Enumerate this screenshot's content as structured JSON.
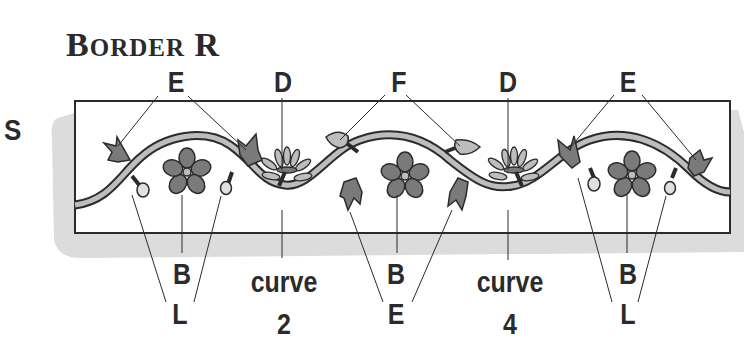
{
  "title": {
    "first": "B",
    "rest": "ORDER",
    "suffix": "R"
  },
  "side_label": "S",
  "top_labels": [
    {
      "text": "E",
      "x": 176
    },
    {
      "text": "D",
      "x": 283
    },
    {
      "text": "F",
      "x": 399
    },
    {
      "text": "D",
      "x": 508
    },
    {
      "text": "E",
      "x": 628
    }
  ],
  "bottom_labels": [
    {
      "text": "B",
      "x": 182
    },
    {
      "text": "L",
      "x": 180
    },
    {
      "text": "curve",
      "x": 284
    },
    {
      "text": "2",
      "x": 284
    },
    {
      "text": "B",
      "x": 396
    },
    {
      "text": "E",
      "x": 396
    },
    {
      "text": "curve",
      "x": 510
    },
    {
      "text": "4",
      "x": 510
    },
    {
      "text": "B",
      "x": 628
    },
    {
      "text": "L",
      "x": 628
    }
  ],
  "colors": {
    "ink": "#2b2b2b",
    "fill_dark": "#7a7a7a",
    "fill_light": "#bdbdbd",
    "paper_shadow": "#dcdcdc"
  },
  "legend": {
    "B": "five-petal flower",
    "D": "spray flower",
    "E": "tulip leaf",
    "F": "bud",
    "L": "berry"
  }
}
